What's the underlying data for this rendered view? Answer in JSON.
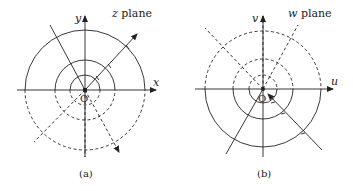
{
  "panels": [
    {
      "id": "a",
      "caption": "(a)",
      "plane_label_var": "z",
      "plane_label_word": "plane",
      "x_axis_label": "x",
      "y_axis_label": "y",
      "origin_label": "O",
      "circle_radii": [
        15,
        30,
        60
      ],
      "upper_half_style": "solid",
      "lower_half_style": "dashed"
    },
    {
      "id": "b",
      "caption": "(b)",
      "plane_label_var": "w",
      "plane_label_word": "plane",
      "x_axis_label": "u",
      "y_axis_label": "v",
      "origin_label": "O",
      "circle_radii": [
        14,
        30,
        58
      ],
      "upper_half_style": "dashed",
      "lower_half_style": "solid"
    }
  ],
  "colors": {
    "ink": "#222222",
    "background": "#ffffff"
  }
}
